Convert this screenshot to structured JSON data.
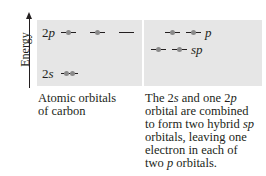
{
  "axis": {
    "label": "Energy"
  },
  "left_panel": {
    "levels": [
      {
        "number": "2",
        "letter": "p",
        "orbitals": [
          {
            "electrons": 1
          },
          {
            "electrons": 1
          },
          {
            "electrons": 0
          }
        ]
      },
      {
        "number": "2",
        "letter": "s",
        "orbitals": [
          {
            "electrons": 2
          }
        ]
      }
    ],
    "caption_lines": [
      "Atomic orbitals",
      "of carbon"
    ]
  },
  "right_panel": {
    "levels": [
      {
        "label": "p",
        "orbitals": [
          {
            "electrons": 1
          },
          {
            "electrons": 1
          }
        ]
      },
      {
        "label": "sp",
        "orbitals": [
          {
            "electrons": 1
          },
          {
            "electrons": 1
          }
        ]
      }
    ],
    "caption": {
      "line1_a": "The 2",
      "line1_s": "s",
      "line1_b": " and one 2",
      "line1_p": "p",
      "line2": "orbital are combined",
      "line3_a": "to form two hybrid ",
      "line3_sp": "sp",
      "line4": "orbitals, leaving one",
      "line5": "electron in each of",
      "line6_a": "two ",
      "line6_p": "p",
      "line6_b": " orbitals."
    }
  },
  "colors": {
    "panel_bg": "#e6e6e6",
    "electron": "#8a8a8a",
    "line": "#231f20"
  }
}
